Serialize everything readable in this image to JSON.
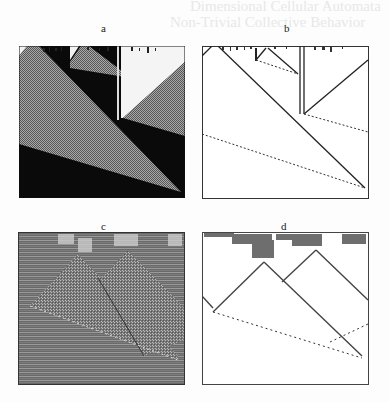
{
  "figure": {
    "background_text": {
      "line1": "Dimensional Cellular Automata",
      "line2": "Non-Trivial Collective Behavior"
    },
    "panels": [
      {
        "id": "a",
        "label": "a",
        "style": "black background with gray checkerboard triangles",
        "colors": {
          "bg": "#0a0a0a",
          "fill": "#7a7a7a",
          "light": "#f4f4f4"
        }
      },
      {
        "id": "b",
        "label": "b",
        "style": "white background with line-drawn particle trajectories",
        "colors": {
          "bg": "#ffffff",
          "line": "#222222"
        }
      },
      {
        "id": "c",
        "label": "c",
        "style": "gray striped background with checkered triangles",
        "colors": {
          "bg": "#6e6e6e",
          "fill": "#8a8a8a"
        }
      },
      {
        "id": "d",
        "label": "d",
        "style": "white background with chaotic top band and particle lines",
        "colors": {
          "bg": "#ffffff",
          "line": "#333333"
        }
      }
    ]
  }
}
